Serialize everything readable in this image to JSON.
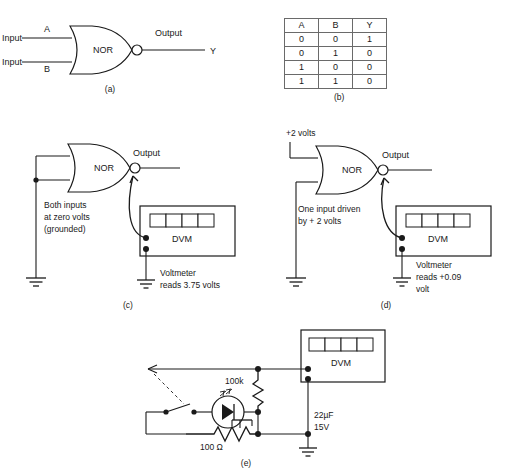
{
  "figure": {
    "panels": [
      "a",
      "b",
      "c",
      "d",
      "e"
    ]
  },
  "panel_a": {
    "caption": "(a)",
    "gate_label": "NOR",
    "input1_label": "Input",
    "input1_name": "A",
    "input2_label": "Input",
    "input2_name": "B",
    "output_label": "Output",
    "output_name": "Y"
  },
  "panel_b": {
    "caption": "(b)",
    "headers": [
      "A",
      "B",
      "Y"
    ],
    "rows": [
      [
        "0",
        "0",
        "1"
      ],
      [
        "0",
        "1",
        "0"
      ],
      [
        "1",
        "0",
        "0"
      ],
      [
        "1",
        "1",
        "0"
      ]
    ]
  },
  "panel_c": {
    "caption": "(c)",
    "gate_label": "NOR",
    "output_label": "Output",
    "note_line1": "Both inputs",
    "note_line2": "at zero volts",
    "note_line3": "(grounded)",
    "meter_label": "DVM",
    "reading_line1": "Voltmeter",
    "reading_line2": "reads 3.75 volts"
  },
  "panel_d": {
    "caption": "(d)",
    "gate_label": "NOR",
    "supply_label": "+2 volts",
    "output_label": "Output",
    "note_line1": "One input driven",
    "note_line2": "by + 2 volts",
    "meter_label": "DVM",
    "reading_line1": "Voltmeter",
    "reading_line2": "reads +0.09",
    "reading_line3": "volt"
  },
  "panel_e": {
    "caption": "(e)",
    "meter_label": "DVM",
    "resistor_top_label": "100k",
    "resistor_bottom_label": "100 Ω",
    "capacitor_line1": "22µF",
    "capacitor_line2": "15V"
  },
  "colors": {
    "ink": "#1a1a1a",
    "paper": "#ffffff",
    "rule": "#6a6a6a"
  }
}
